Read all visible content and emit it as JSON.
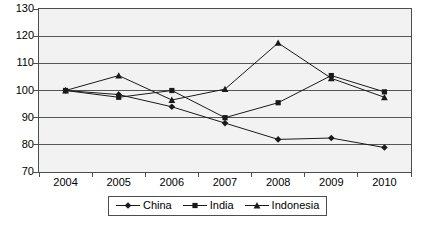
{
  "chart_data": {
    "type": "line",
    "title": "",
    "subtitle": "",
    "xlabel": "",
    "ylabel": "",
    "categories": [
      "2004",
      "2005",
      "2006",
      "2007",
      "2008",
      "2009",
      "2010"
    ],
    "ylim": [
      70,
      130
    ],
    "ytick_labels": [
      "70",
      "80",
      "90",
      "100",
      "110",
      "120",
      "130"
    ],
    "ytick_values": [
      70,
      80,
      90,
      100,
      110,
      120,
      130
    ],
    "grid": true,
    "grid_axis": "y",
    "legend_position": "bottom",
    "plot_background": "#f2f2f2",
    "line_color": "#333333",
    "series": [
      {
        "name": "China",
        "marker": "diamond",
        "color": "#1a1a1a",
        "values": [
          100,
          98.5,
          94,
          88,
          82,
          82.5,
          79
        ]
      },
      {
        "name": "India",
        "marker": "square",
        "color": "#1a1a1a",
        "values": [
          100,
          97.5,
          100,
          90,
          95.5,
          105.5,
          99.5
        ]
      },
      {
        "name": "Indonesia",
        "marker": "triangle",
        "color": "#1a1a1a",
        "values": [
          100,
          105.5,
          96.5,
          100.5,
          117.5,
          104.5,
          97.5
        ]
      }
    ]
  }
}
